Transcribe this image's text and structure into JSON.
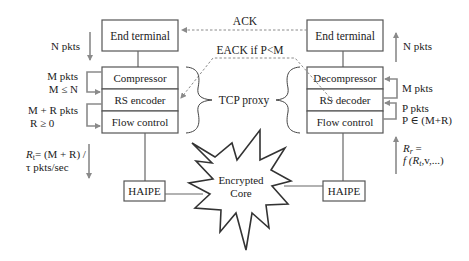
{
  "left": {
    "end_terminal": "End terminal",
    "stack": [
      "Compressor",
      "RS encoder",
      "Flow control"
    ],
    "haipe": "HAIPE",
    "labels": {
      "n_pkts": "N pkts",
      "m_pkts": "M pkts",
      "m_cond": "M ≤ N",
      "mr_pkts": "M + R pkts",
      "r_cond": "R ≥ 0",
      "rate_line1": "= (M + R) /",
      "rate_var": "R",
      "rate_sub": "t",
      "rate_line2": "τ pkts/sec"
    }
  },
  "right": {
    "end_terminal": "End terminal",
    "stack": [
      "Decompressor",
      "RS decoder",
      "Flow control"
    ],
    "haipe": "HAIPE",
    "labels": {
      "n_pkts": "N pkts",
      "m_pkts": "M pkts",
      "p_pkts": "P pkts",
      "p_cond": "P ∈ (M+R)",
      "rate_var": "R",
      "rate_sub": "r",
      "rate_eq": " =",
      "rate_line2_pre": "f (R",
      "rate_line2_sub": "t",
      "rate_line2_post": ",v,...)"
    }
  },
  "center": {
    "ack": "ACK",
    "eack": "EACK if P<M",
    "tcp_proxy": "TCP proxy",
    "core_line1": "Encrypted",
    "core_line2": "Core"
  },
  "colors": {
    "box_stroke": "#555555",
    "arrow_gray": "#8a8a8a",
    "text": "#222222"
  }
}
